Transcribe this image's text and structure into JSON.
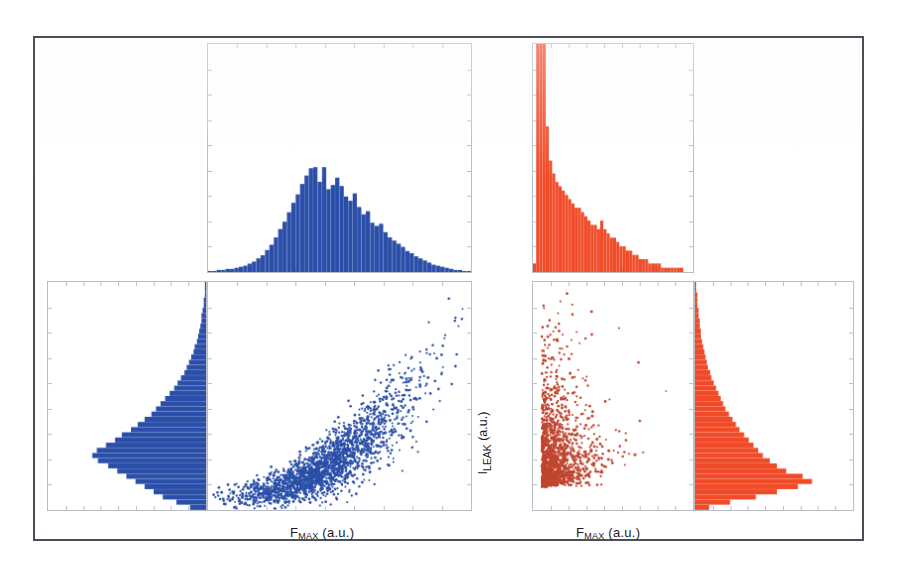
{
  "figure": {
    "background_color": "#ffffff",
    "frame_color": "#4a4f57",
    "axis_color": "#b9bec6",
    "blue_color": "#2b4fa8",
    "red_color": "#f04a28",
    "red_scatter_color": "#c0452f"
  },
  "labels": {
    "xlabel_left_main": "F",
    "xlabel_left_sub": "MAX",
    "xlabel_left_unit": " (a.u.)",
    "xlabel_right_main": "F",
    "xlabel_right_sub": "MAX",
    "xlabel_right_unit": " (a.u.)",
    "ylabel_main": "I",
    "ylabel_sub": "LEAK",
    "ylabel_unit": " (a.u.)"
  },
  "chart_data": [
    {
      "type": "scatter",
      "name": "left-panel-scatter",
      "title": "",
      "xlabel": "F_MAX (a.u.)",
      "ylabel": "I_LEAK (a.u.)",
      "color": "#2b4fa8",
      "xlim": [
        0,
        1
      ],
      "ylim": [
        0,
        1
      ],
      "grid": false,
      "n_points": 2100,
      "relationship": "strong positive, curving upward (power-law like)",
      "description": "Dense elongated band rising from lower-left to upper-right with increasing vertical spread at high F_MAX.",
      "model": {
        "x_dist": "beta-like centered 0.44 spread 0.17",
        "y_given_x": "y = 0.055 + 0.80*pow(x,2.25) + noise",
        "noise_scale_base": 0.03,
        "noise_scale_slope": 0.145
      }
    },
    {
      "type": "histogram",
      "name": "left-top-marginal-hist",
      "orientation": "vertical",
      "color": "#2b4fa8",
      "xlabel": "F_MAX (a.u.)",
      "ylabel": "count",
      "grid": false,
      "n_bins": 60,
      "description": "Approximately Gaussian / slightly right-skewed distribution of F_MAX peaking near the middle-left of the axis.",
      "bin_centers": [
        0.008,
        0.025,
        0.042,
        0.058,
        0.075,
        0.092,
        0.108,
        0.125,
        0.142,
        0.158,
        0.175,
        0.192,
        0.208,
        0.225,
        0.242,
        0.258,
        0.275,
        0.292,
        0.308,
        0.325,
        0.342,
        0.358,
        0.375,
        0.392,
        0.408,
        0.425,
        0.442,
        0.458,
        0.475,
        0.492,
        0.508,
        0.525,
        0.542,
        0.558,
        0.575,
        0.592,
        0.608,
        0.625,
        0.642,
        0.658,
        0.675,
        0.692,
        0.708,
        0.725,
        0.742,
        0.758,
        0.775,
        0.792,
        0.808,
        0.825,
        0.842,
        0.858,
        0.875,
        0.892,
        0.908,
        0.925,
        0.942,
        0.958,
        0.975,
        0.992
      ],
      "counts": [
        1,
        1,
        2,
        2,
        3,
        3,
        4,
        5,
        6,
        8,
        10,
        13,
        16,
        21,
        26,
        33,
        41,
        48,
        57,
        66,
        74,
        84,
        92,
        99,
        100,
        86,
        100,
        79,
        83,
        90,
        82,
        72,
        68,
        75,
        62,
        55,
        58,
        47,
        44,
        46,
        38,
        33,
        30,
        27,
        24,
        20,
        18,
        15,
        13,
        11,
        9,
        7,
        6,
        5,
        4,
        3,
        2,
        2,
        1,
        1
      ]
    },
    {
      "type": "histogram",
      "name": "left-side-marginal-hist",
      "orientation": "horizontal",
      "direction": "leftward-from-right-edge",
      "color": "#2b4fa8",
      "xlabel": "count",
      "ylabel": "I_LEAK (a.u.)",
      "grid": false,
      "n_bins": 44,
      "description": "Right-anchored horizontal histogram of I_LEAK; sharply peaked near the lower-middle with a thin tail toward high I_LEAK.",
      "bin_centers": [
        0.011,
        0.034,
        0.057,
        0.08,
        0.102,
        0.125,
        0.148,
        0.17,
        0.193,
        0.216,
        0.239,
        0.261,
        0.284,
        0.307,
        0.33,
        0.352,
        0.375,
        0.398,
        0.42,
        0.443,
        0.466,
        0.489,
        0.511,
        0.534,
        0.557,
        0.58,
        0.602,
        0.625,
        0.648,
        0.67,
        0.693,
        0.716,
        0.739,
        0.761,
        0.784,
        0.807,
        0.83,
        0.852,
        0.875,
        0.898,
        0.92,
        0.943,
        0.966,
        0.989
      ],
      "counts": [
        14,
        26,
        38,
        46,
        54,
        62,
        70,
        78,
        86,
        95,
        100,
        96,
        88,
        80,
        74,
        66,
        60,
        54,
        48,
        44,
        40,
        36,
        32,
        28,
        25,
        22,
        19,
        17,
        15,
        13,
        11,
        10,
        8,
        7,
        6,
        5,
        4,
        4,
        3,
        2,
        2,
        1,
        1,
        1
      ]
    },
    {
      "type": "scatter",
      "name": "right-panel-scatter",
      "title": "",
      "xlabel": "F_MAX (a.u.)",
      "ylabel": "I_LEAK (a.u.)",
      "color": "#c0452f",
      "xlim": [
        0,
        1
      ],
      "ylim": [
        0,
        1
      ],
      "grid": false,
      "n_points": 1500,
      "relationship": "weak / no correlation; dense narrow vertical cluster at low F_MAX with diffuse rightward and upward scatter",
      "description": "Tight vertical column of points near the left edge spreading into a sparse fan toward higher F_MAX and higher I_LEAK.",
      "model": {
        "x_dist": "exponential-like, heavily concentrated near 0.06",
        "y_dist": "skewed, concentrated low with long upper tail"
      }
    },
    {
      "type": "histogram",
      "name": "right-top-marginal-hist",
      "orientation": "vertical",
      "color": "#f04a28",
      "xlabel": "F_MAX (a.u.)",
      "ylabel": "count",
      "grid": false,
      "n_bins": 50,
      "clipped": true,
      "description": "Extremely sharp narrow spike near the left edge that is clipped at the top of the axes, followed by a rapidly decaying long right tail.",
      "bin_centers": [
        0.01,
        0.03,
        0.05,
        0.07,
        0.09,
        0.11,
        0.13,
        0.15,
        0.17,
        0.19,
        0.21,
        0.23,
        0.25,
        0.27,
        0.29,
        0.31,
        0.33,
        0.35,
        0.37,
        0.39,
        0.41,
        0.43,
        0.45,
        0.47,
        0.49,
        0.51,
        0.53,
        0.55,
        0.57,
        0.59,
        0.61,
        0.63,
        0.65,
        0.67,
        0.69,
        0.71,
        0.73,
        0.75,
        0.77,
        0.79,
        0.81,
        0.83,
        0.85,
        0.87,
        0.89,
        0.91,
        0.93,
        0.95,
        0.97,
        0.99
      ],
      "counts": [
        2,
        125,
        125,
        78,
        34,
        26,
        23,
        21,
        20,
        19,
        18,
        17,
        16,
        15,
        15,
        14,
        13,
        12,
        11,
        11,
        10,
        12,
        10,
        9,
        8,
        8,
        7,
        6,
        6,
        5,
        5,
        4,
        4,
        3,
        3,
        3,
        2,
        2,
        2,
        2,
        1,
        1,
        1,
        1,
        1,
        1,
        1,
        0,
        0,
        0
      ]
    },
    {
      "type": "histogram",
      "name": "right-side-marginal-hist",
      "orientation": "horizontal",
      "direction": "rightward-from-left-edge",
      "color": "#f04a28",
      "xlabel": "count",
      "ylabel": "I_LEAK (a.u.)",
      "grid": false,
      "n_bins": 44,
      "description": "Left-anchored horizontal histogram of I_LEAK; narrow tail at high I_LEAK, broad peak in the lower third, maximum bar near the bottom.",
      "bin_centers": [
        0.011,
        0.034,
        0.057,
        0.08,
        0.102,
        0.125,
        0.148,
        0.17,
        0.193,
        0.216,
        0.239,
        0.261,
        0.284,
        0.307,
        0.33,
        0.352,
        0.375,
        0.398,
        0.42,
        0.443,
        0.466,
        0.489,
        0.511,
        0.534,
        0.557,
        0.58,
        0.602,
        0.625,
        0.648,
        0.67,
        0.693,
        0.716,
        0.739,
        0.761,
        0.784,
        0.807,
        0.83,
        0.852,
        0.875,
        0.898,
        0.92,
        0.943,
        0.966,
        0.989
      ],
      "counts": [
        12,
        30,
        52,
        70,
        88,
        100,
        92,
        78,
        70,
        64,
        58,
        54,
        50,
        46,
        42,
        38,
        35,
        32,
        29,
        26,
        24,
        22,
        20,
        18,
        16,
        14,
        13,
        11,
        10,
        9,
        8,
        7,
        6,
        5,
        5,
        4,
        4,
        3,
        3,
        2,
        2,
        2,
        1,
        1
      ]
    }
  ]
}
